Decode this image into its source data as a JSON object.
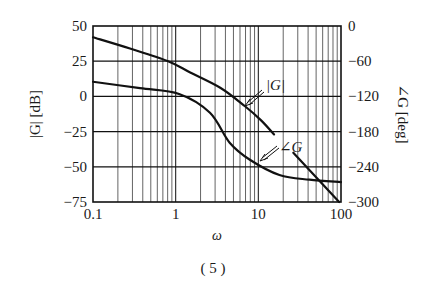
{
  "chart_data": {
    "type": "line",
    "title": "",
    "caption": "( 5 )",
    "xlabel": "ω",
    "xscale": "log",
    "xlim": [
      0.1,
      100
    ],
    "x_ticks": [
      "0.1",
      "1",
      "10",
      "100"
    ],
    "ylabel_left": "|G| [dB]",
    "ylim_left": [
      -75,
      50
    ],
    "y_ticks_left": [
      "50",
      "25",
      "0",
      "−25",
      "−50",
      "−75"
    ],
    "ylabel_right": "∠G [deg]",
    "ylim_right": [
      -300,
      0
    ],
    "y_ticks_right": [
      "0",
      "−60",
      "−120",
      "−180",
      "−240",
      "−300"
    ],
    "grid": true,
    "legend": "annotations",
    "annotations": [
      {
        "text": "|G|",
        "points_to": "magnitude"
      },
      {
        "text": "∠G",
        "points_to": "phase"
      }
    ],
    "series": [
      {
        "name": "|G|",
        "axis": "left",
        "unit": "dB",
        "x": [
          0.1,
          0.28,
          0.81,
          1.5,
          3.5,
          6.9,
          10.8,
          15.5
        ],
        "values": [
          42,
          34,
          25,
          17,
          6,
          -7,
          -17,
          -27
        ]
      },
      {
        "name": "∠G",
        "axis": "right",
        "unit": "deg",
        "x": [
          0.1,
          0.37,
          1.1,
          2.6,
          4.5,
          7.9,
          18.0,
          41.5,
          100
        ],
        "values": [
          -95,
          -106,
          -116,
          -148,
          -199,
          -228,
          -254,
          -262,
          -266
        ]
      },
      {
        "name": "∠G (steep segment)",
        "axis": "right",
        "unit": "deg",
        "x": [
          26.5,
          95
        ],
        "values": [
          -216,
          -300
        ]
      }
    ]
  }
}
